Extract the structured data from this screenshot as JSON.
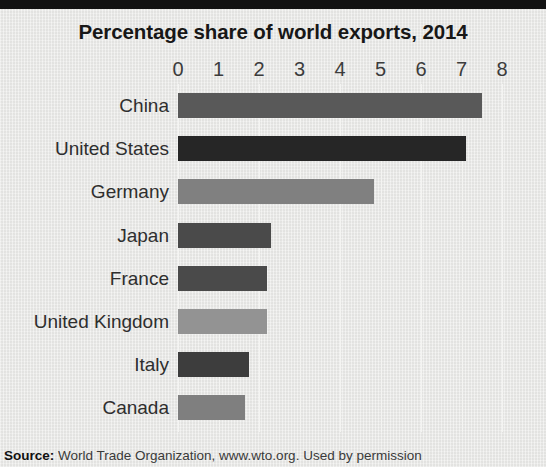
{
  "chart_data": {
    "type": "bar",
    "orientation": "horizontal",
    "title": "Percentage share of world exports, 2014",
    "xlabel": "",
    "ylabel": "",
    "xlim": [
      0,
      8
    ],
    "xticks": [
      0,
      1,
      2,
      3,
      4,
      5,
      6,
      7,
      8
    ],
    "grid": true,
    "legend": "none",
    "categories": [
      "China",
      "United States",
      "Germany",
      "Japan",
      "France",
      "United Kingdom",
      "Italy",
      "Canada"
    ],
    "values": [
      7.5,
      7.1,
      4.85,
      2.3,
      2.2,
      2.2,
      1.75,
      1.65
    ],
    "bar_colors": [
      "#595959",
      "#262626",
      "#808080",
      "#4a4a4a",
      "#4a4a4a",
      "#939393",
      "#3d3d3d",
      "#7f7f7f"
    ],
    "source_prefix": "Source:",
    "source_text": "World Trade Organization, www.wto.org. Used by permission"
  },
  "colors": {
    "background": "#e9e9e7",
    "top_band": "#121212",
    "gridline": "#f4f4f2",
    "title_text": "#171717",
    "label_text": "#2e2e2e"
  }
}
